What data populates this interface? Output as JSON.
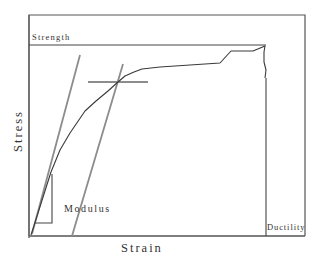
{
  "diagram": {
    "type": "stress-strain-curve",
    "labels": {
      "strength": "Strength",
      "stress": "Stress",
      "strain": "Strain",
      "modulus": "Modulus",
      "ductility": "Ductility"
    },
    "colors": {
      "frame": "#555555",
      "curve": "#3a3a3a",
      "construction_lines": "#8c8c8c",
      "text": "#333333"
    },
    "annotations": [
      {
        "name": "yield-offset-line",
        "description": "Grey line parallel to elastic region (0.2% offset)"
      },
      {
        "name": "elastic-line",
        "description": "Grey line tangent to initial elastic region"
      },
      {
        "name": "yield-point-marker",
        "description": "Grey horizontal line marking yield stress"
      },
      {
        "name": "modulus-triangle",
        "description": "Slope triangle indicating elastic modulus"
      },
      {
        "name": "strength-line",
        "description": "Horizontal line at ultimate tensile strength"
      },
      {
        "name": "ductility-line",
        "description": "Vertical line at fracture strain"
      }
    ]
  }
}
